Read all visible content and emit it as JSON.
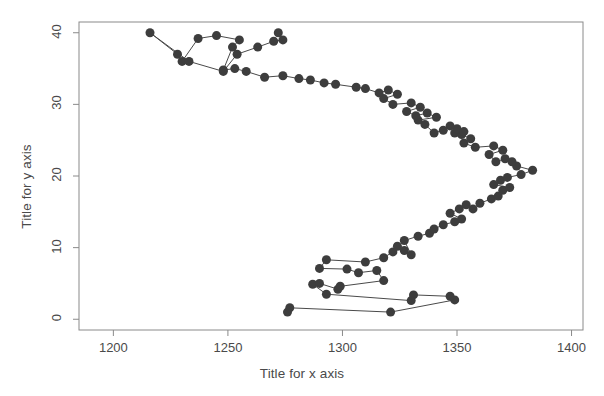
{
  "chart_data": {
    "type": "line",
    "title": "",
    "subtitle": "",
    "xlabel": "Title for x axis",
    "ylabel": "Title for y axis",
    "xlim": [
      1185,
      1405
    ],
    "ylim": [
      -1.5,
      41.5
    ],
    "xticks": [
      1200,
      1250,
      1300,
      1350,
      1400
    ],
    "xtick_labels": [
      "1200",
      "1250",
      "1300",
      "1350",
      "1400"
    ],
    "yticks": [
      0,
      10,
      20,
      30,
      40
    ],
    "ytick_labels": [
      "0",
      "10",
      "20",
      "30",
      "40"
    ],
    "grid": false,
    "legend": null,
    "marker": "filled-circle",
    "marker_color": "#3d3d3d",
    "marker_size": 9,
    "line_color": "#4a4a4a",
    "line_width": 1,
    "frame_color": "#8a8a8a",
    "series": [
      {
        "name": "series-1",
        "x": [
          1276,
          1277,
          1321,
          1349,
          1347,
          1331,
          1330,
          1293,
          1287,
          1290,
          1298,
          1299,
          1318,
          1315,
          1307,
          1302,
          1290,
          1293,
          1310,
          1318,
          1322,
          1324,
          1327,
          1330,
          1327,
          1333,
          1338,
          1340,
          1344,
          1349,
          1352,
          1347,
          1351,
          1354,
          1357,
          1360,
          1365,
          1368,
          1370,
          1373,
          1366,
          1369,
          1372,
          1378,
          1383,
          1376,
          1374,
          1371,
          1367,
          1364,
          1370,
          1366,
          1358,
          1353,
          1356,
          1352,
          1349,
          1350,
          1353,
          1347,
          1344,
          1340,
          1336,
          1333,
          1341,
          1337,
          1332,
          1328,
          1334,
          1330,
          1322,
          1318,
          1324,
          1320,
          1316,
          1310,
          1306,
          1297,
          1292,
          1286,
          1281,
          1274,
          1266,
          1258,
          1253,
          1248,
          1252,
          1255,
          1245,
          1237,
          1230,
          1228,
          1216,
          1233,
          1248,
          1254,
          1263,
          1270,
          1274,
          1272
        ],
        "y": [
          1.0,
          1.6,
          1.0,
          2.7,
          3.2,
          3.4,
          2.6,
          3.5,
          4.9,
          5.0,
          4.2,
          4.6,
          5.4,
          6.8,
          6.5,
          7.0,
          7.1,
          8.3,
          8.0,
          8.6,
          9.4,
          10.2,
          9.6,
          9.0,
          11.0,
          11.6,
          12.0,
          12.6,
          13.2,
          13.6,
          14.0,
          14.8,
          15.4,
          16.0,
          15.4,
          16.2,
          16.8,
          17.2,
          18.0,
          18.4,
          18.8,
          19.4,
          19.8,
          20.2,
          20.8,
          21.4,
          22.0,
          22.4,
          22.0,
          23.0,
          23.6,
          24.2,
          24.0,
          24.6,
          25.2,
          25.8,
          26.0,
          26.6,
          26.2,
          27.0,
          26.4,
          26.0,
          27.2,
          27.8,
          28.2,
          28.8,
          28.4,
          29.0,
          29.6,
          30.2,
          30.0,
          30.8,
          31.4,
          32.0,
          31.6,
          32.2,
          32.4,
          32.8,
          33.0,
          33.4,
          33.6,
          34.0,
          33.8,
          34.6,
          35.0,
          34.8,
          38.0,
          39.0,
          39.6,
          39.2,
          36.0,
          37.0,
          40.0,
          36.0,
          34.6,
          37.0,
          38.0,
          38.8,
          39.0,
          40.0
        ]
      }
    ]
  }
}
